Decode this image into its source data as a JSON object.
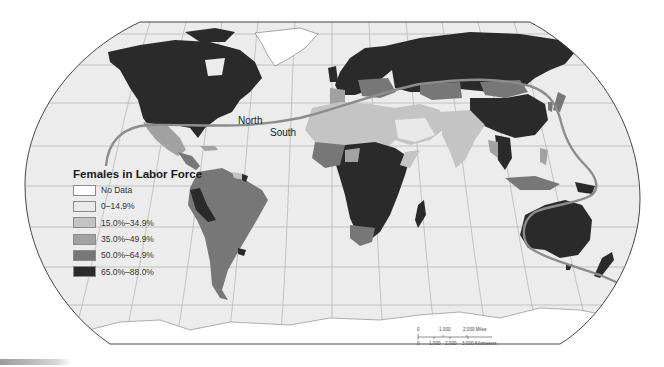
{
  "map": {
    "title": "Females in Labor Force",
    "projection": "Robinson world map",
    "style": "grayscale choropleth",
    "colors": {
      "background": "#ffffff",
      "ocean": "#ececec",
      "graticule": "#b8b8b8",
      "divide_line": "#8c8c8c",
      "outline": "#333333"
    },
    "divide_labels": {
      "north": "North",
      "south": "South"
    }
  },
  "legend": {
    "title": "Females in Labor Force",
    "items": [
      {
        "label": "No Data",
        "color": "#ffffff"
      },
      {
        "label": "0–14.9%",
        "color": "#e9e9e9"
      },
      {
        "label": "15.0%–34.9%",
        "color": "#c4c4c4"
      },
      {
        "label": "35.0%–49.9%",
        "color": "#a2a2a2"
      },
      {
        "label": "50.0%–64.9%",
        "color": "#777777"
      },
      {
        "label": "65.0%–88.0%",
        "color": "#2a2a2a"
      }
    ]
  },
  "scale_bar": {
    "miles_ticks": [
      "0",
      "1,000",
      "2,000 Miles"
    ],
    "km_ticks": [
      "0",
      "1,000",
      "2,000",
      "3,000 Kilometers"
    ]
  }
}
